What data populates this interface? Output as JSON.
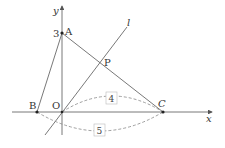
{
  "diagram": {
    "type": "coordinate-geometry",
    "axes": {
      "x_label": "x",
      "y_label": "y",
      "origin_label": "O"
    },
    "points": [
      {
        "name": "A",
        "label": "A",
        "coord_label": "3",
        "px": [
          62,
          33
        ]
      },
      {
        "name": "B",
        "label": "B",
        "px": [
          37,
          112
        ]
      },
      {
        "name": "O",
        "label": "O",
        "px": [
          62,
          112
        ]
      },
      {
        "name": "C",
        "label": "C",
        "px": [
          163,
          112
        ]
      },
      {
        "name": "P",
        "label": "P",
        "px": [
          104,
          64
        ]
      }
    ],
    "line_l": {
      "label": "l"
    },
    "segments": [
      "AB",
      "AC"
    ],
    "dimensions": [
      {
        "between": "O-C",
        "value": "4"
      },
      {
        "between": "B-C",
        "value": "5"
      }
    ]
  },
  "colors": {
    "line": "#555555",
    "dashed": "#888888",
    "text": "#333333"
  }
}
